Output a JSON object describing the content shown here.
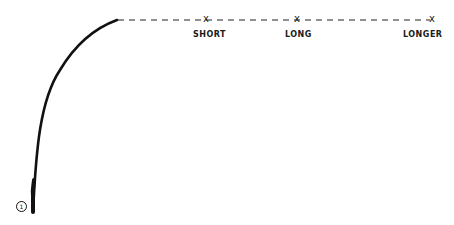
{
  "diagram": {
    "figure_number": "1",
    "line_color": "#111111",
    "marks": [
      {
        "label": "SHORT",
        "x_mark": "x"
      },
      {
        "label": "LONG",
        "x_mark": "x"
      },
      {
        "label": "LONGER",
        "x_mark": "x"
      }
    ]
  }
}
